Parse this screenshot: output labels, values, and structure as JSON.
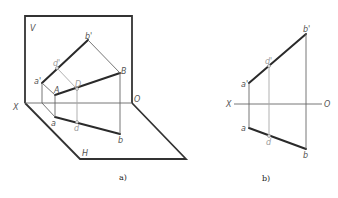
{
  "figure_a": {
    "caption": "a)",
    "labels": {
      "V": "V",
      "H": "H",
      "X": "X",
      "O": "O",
      "a_prime": "a'",
      "b_prime": "b'",
      "d_prime": "d'",
      "A": "A",
      "B": "B",
      "D": "D",
      "a": "a",
      "b": "b",
      "d": "d"
    }
  },
  "figure_b": {
    "caption": "b)",
    "labels": {
      "X": "X",
      "O": "O",
      "a_prime": "a'",
      "b_prime": "b'",
      "d_prime": "d'",
      "a": "a",
      "b": "b",
      "d": "d"
    }
  },
  "colors": {
    "thick_line": "#2a2a2a",
    "thin_line": "#666666",
    "light_line": "#a8a8a8",
    "background": "#ffffff"
  }
}
